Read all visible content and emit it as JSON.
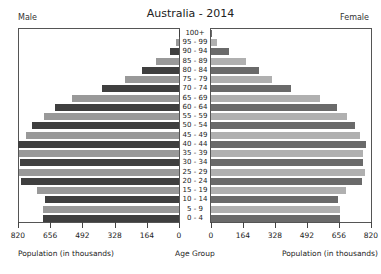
{
  "chart_data": {
    "type": "bar",
    "subtype": "population-pyramid",
    "title": "Australia - 2014",
    "left_label": "Male",
    "right_label": "Female",
    "xlabel_left": "Population (in thousands)",
    "xlabel_center": "Age Group",
    "xlabel_right": "Population (in thousands)",
    "xlim": [
      0,
      820
    ],
    "male_ticks": [
      "820",
      "656",
      "492",
      "328",
      "164",
      "0"
    ],
    "female_ticks": [
      "0",
      "164",
      "328",
      "492",
      "656",
      "820"
    ],
    "categories": [
      "100+",
      "95 - 99",
      "90 - 94",
      "85 - 89",
      "80 - 84",
      "75 - 79",
      "70 - 74",
      "65 - 69",
      "60 - 64",
      "55 - 59",
      "50 - 54",
      "45 - 49",
      "40 - 44",
      "35 - 39",
      "30 - 34",
      "25 - 29",
      "20 - 24",
      "15 - 19",
      "10 - 14",
      "5 - 9",
      "0 - 4"
    ],
    "series": [
      {
        "name": "Male",
        "values": [
          1,
          13,
          46,
          115,
          186,
          273,
          391,
          547,
          631,
          690,
          747,
          777,
          820,
          813,
          810,
          813,
          805,
          725,
          682,
          694,
          694
        ]
      },
      {
        "name": "Female",
        "values": [
          7,
          29,
          94,
          179,
          244,
          311,
          410,
          559,
          644,
          697,
          740,
          764,
          793,
          779,
          779,
          791,
          774,
          694,
          653,
          661,
          661
        ]
      }
    ],
    "grid": false,
    "legend": "none"
  },
  "colors": {
    "male_dark": "#3f3f3f",
    "male_light": "#999999",
    "female_dark": "#6a6a6a",
    "female_light": "#b0b0b0"
  }
}
